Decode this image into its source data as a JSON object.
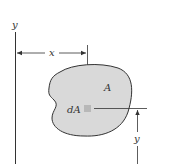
{
  "diagram": {
    "labels": {
      "y_axis": "y",
      "x_dimension": "x",
      "y_dimension": "y",
      "area": "A",
      "element": "dA"
    },
    "colors": {
      "shape_fill": "#d9d9d9",
      "element_fill": "#b8b8b8",
      "line": "#333333",
      "background": "#ffffff"
    }
  }
}
